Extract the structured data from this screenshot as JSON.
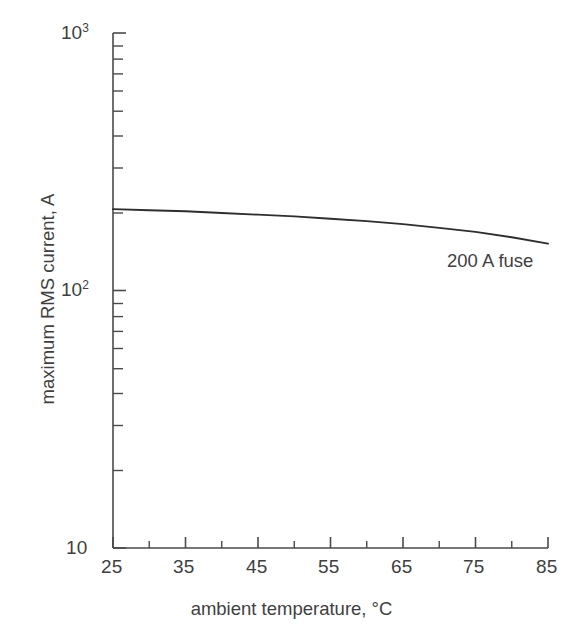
{
  "chart_data": {
    "type": "line",
    "title": "",
    "xlabel": "ambient temperature, °C",
    "ylabel": "maximum RMS current, A",
    "xlim": [
      25,
      85
    ],
    "ylim": [
      10,
      1000
    ],
    "yscale": "log",
    "xscale": "linear",
    "grid": false,
    "legend": "none",
    "x_ticks": [
      "25",
      "35",
      "45",
      "55",
      "65",
      "75",
      "85"
    ],
    "x_tick_values": [
      25,
      35,
      45,
      55,
      65,
      75,
      85
    ],
    "x_minor_tick_values": [
      30,
      40,
      50,
      60,
      70,
      80
    ],
    "y_ticks": [
      "10",
      "100",
      "1000"
    ],
    "y_tick_labels": [
      "10",
      "10²",
      "10³"
    ],
    "y_tick_values": [
      10,
      100,
      1000
    ],
    "y_minor_tick_values": [
      20,
      30,
      40,
      50,
      60,
      70,
      80,
      90,
      200,
      300,
      400,
      500,
      600,
      700,
      800,
      900
    ],
    "annotations": [
      {
        "text": "200 A fuse",
        "x": 78,
        "y": 130
      }
    ],
    "series": [
      {
        "name": "200 A fuse",
        "x": [
          25,
          30,
          35,
          40,
          45,
          50,
          55,
          60,
          65,
          70,
          75,
          80,
          85
        ],
        "values": [
          207,
          205,
          203,
          200,
          197,
          194,
          190,
          186,
          181,
          175,
          169,
          161,
          152
        ]
      }
    ]
  },
  "axis": {
    "y_label_top": "10",
    "y_label_top_exp": "3",
    "y_label_mid": "10",
    "y_label_mid_exp": "2",
    "y_label_bottom": "10",
    "y_title": "maximum RMS current, A",
    "x_title": "ambient temperature, °C"
  },
  "annotation": {
    "fuse_label": "200 A fuse"
  },
  "colors": {
    "axis": "#4a4a4a",
    "curve": "#2e2e2e",
    "text": "#3f3f3f",
    "background": "#ffffff"
  }
}
